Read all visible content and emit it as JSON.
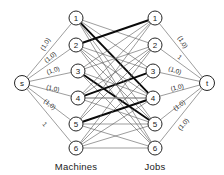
{
  "figure": {
    "type": "bipartite-network-flow-diagram",
    "width": 224,
    "height": 175,
    "background_color": "#ffffff",
    "ink_color": "#1a1a1a"
  },
  "captions": {
    "left": "Machines",
    "right": "Jobs"
  },
  "nodes": {
    "source": {
      "id": "s",
      "label": "s",
      "cx": 22,
      "cy": 83,
      "r": 7.5
    },
    "sink": {
      "id": "t",
      "label": "t",
      "cx": 207,
      "cy": 83,
      "r": 7.5
    },
    "machines": [
      {
        "id": "m1",
        "label": "1",
        "cx": 76,
        "cy": 18,
        "r": 7
      },
      {
        "id": "m2",
        "label": "2",
        "cx": 76,
        "cy": 45,
        "r": 7
      },
      {
        "id": "m3",
        "label": "3",
        "cx": 78,
        "cy": 71,
        "r": 7
      },
      {
        "id": "m4",
        "label": "4",
        "cx": 78,
        "cy": 98,
        "r": 7
      },
      {
        "id": "m5",
        "label": "5",
        "cx": 76,
        "cy": 124,
        "r": 7
      },
      {
        "id": "m6",
        "label": "6",
        "cx": 76,
        "cy": 148,
        "r": 7
      }
    ],
    "jobs": [
      {
        "id": "j1",
        "label": "1",
        "cx": 155,
        "cy": 18,
        "r": 7
      },
      {
        "id": "j2",
        "label": "2",
        "cx": 155,
        "cy": 45,
        "r": 7
      },
      {
        "id": "j3",
        "label": "3",
        "cx": 153,
        "cy": 71,
        "r": 7
      },
      {
        "id": "j4",
        "label": "4",
        "cx": 153,
        "cy": 98,
        "r": 7
      },
      {
        "id": "j5",
        "label": "5",
        "cx": 155,
        "cy": 124,
        "r": 7
      },
      {
        "id": "j6",
        "label": "6",
        "cx": 155,
        "cy": 148,
        "r": 7
      }
    ]
  },
  "source_edges": [
    {
      "from": "s",
      "to": "m1",
      "label": "(1,0)",
      "lx": 45,
      "ly": 44,
      "rot": -58
    },
    {
      "from": "s",
      "to": "m2",
      "label": "(1,0)",
      "lx": 50,
      "ly": 57,
      "rot": -40
    },
    {
      "from": "s",
      "to": "m3",
      "label": "(1,0)",
      "lx": 53,
      "ly": 70,
      "rot": -19
    },
    {
      "from": "s",
      "to": "m4",
      "label": "(1,0)",
      "lx": 53,
      "ly": 88,
      "rot": 13
    },
    {
      "from": "s",
      "to": "m5",
      "label": "(1,0)",
      "lx": 50,
      "ly": 104,
      "rot": 37
    },
    {
      "from": "s",
      "to": "m6",
      "label": "1",
      "lx": 45,
      "ly": 124,
      "rot": 50
    }
  ],
  "sink_edges": [
    {
      "from": "j1",
      "to": "t",
      "label": "(1,0)",
      "lx": 183,
      "ly": 42,
      "rot": 58
    },
    {
      "from": "j2",
      "to": "t",
      "label": "1",
      "lx": 180,
      "ly": 57,
      "rot": 40
    },
    {
      "from": "j3",
      "to": "t",
      "label": "(1,0)",
      "lx": 175,
      "ly": 70,
      "rot": 19
    },
    {
      "from": "j4",
      "to": "t",
      "label": "(1,0)",
      "lx": 177,
      "ly": 87,
      "rot": -13
    },
    {
      "from": "j5",
      "to": "t",
      "label": "(1,0)",
      "lx": 179,
      "ly": 105,
      "rot": -37
    },
    {
      "from": "j6",
      "to": "t",
      "label": "(1,0)",
      "lx": 183,
      "ly": 124,
      "rot": -50
    }
  ],
  "bipartite_edges": [
    {
      "from": "m1",
      "to": "j2",
      "weight": "thin"
    },
    {
      "from": "m1",
      "to": "j3",
      "weight": "thin"
    },
    {
      "from": "m1",
      "to": "j4",
      "weight": "bold"
    },
    {
      "from": "m1",
      "to": "j6",
      "weight": "thin"
    },
    {
      "from": "m2",
      "to": "j1",
      "weight": "bold"
    },
    {
      "from": "m2",
      "to": "j3",
      "weight": "thin"
    },
    {
      "from": "m2",
      "to": "j5",
      "weight": "thin"
    },
    {
      "from": "m2",
      "to": "j6",
      "weight": "thin"
    },
    {
      "from": "m3",
      "to": "j1",
      "weight": "thin"
    },
    {
      "from": "m3",
      "to": "j2",
      "weight": "thin"
    },
    {
      "from": "m3",
      "to": "j5",
      "weight": "bold"
    },
    {
      "from": "m3",
      "to": "j6",
      "weight": "thin"
    },
    {
      "from": "m4",
      "to": "j1",
      "weight": "thin"
    },
    {
      "from": "m4",
      "to": "j2",
      "weight": "thin"
    },
    {
      "from": "m4",
      "to": "j3",
      "weight": "bold"
    },
    {
      "from": "m4",
      "to": "j4",
      "weight": "gray"
    },
    {
      "from": "m4",
      "to": "j5",
      "weight": "thin"
    },
    {
      "from": "m5",
      "to": "j1",
      "weight": "thin"
    },
    {
      "from": "m5",
      "to": "j2",
      "weight": "thin"
    },
    {
      "from": "m5",
      "to": "j4",
      "weight": "bold"
    },
    {
      "from": "m5",
      "to": "j6",
      "weight": "thin"
    },
    {
      "from": "m6",
      "to": "j2",
      "weight": "thin"
    },
    {
      "from": "m6",
      "to": "j3",
      "weight": "thin"
    },
    {
      "from": "m6",
      "to": "j4",
      "weight": "thin"
    },
    {
      "from": "m6",
      "to": "j5",
      "weight": "thin"
    },
    {
      "from": "m1",
      "to": "j5",
      "weight": "thin"
    },
    {
      "from": "m3",
      "to": "j4",
      "weight": "thin"
    },
    {
      "from": "m2",
      "to": "j4",
      "weight": "thin"
    },
    {
      "from": "m5",
      "to": "j5",
      "weight": "thin"
    },
    {
      "from": "m6",
      "to": "j6",
      "weight": "thin"
    }
  ],
  "captions_pos": {
    "left": {
      "x": 76,
      "y": 166
    },
    "right": {
      "x": 155,
      "y": 166
    }
  }
}
